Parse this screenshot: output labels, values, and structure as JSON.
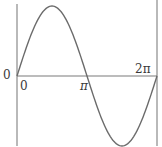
{
  "chart_data": {
    "type": "line",
    "title": "",
    "xlabel": "",
    "ylabel": "",
    "function": "sin(x)",
    "x_range": [
      0,
      6.2832
    ],
    "y_range": [
      -1,
      1
    ],
    "grid": false,
    "legend": null,
    "x_tick_labels": [
      "0",
      "π",
      "2π"
    ],
    "x_ticks": [
      0,
      3.1416,
      6.2832
    ],
    "y_tick_labels": [
      "0"
    ],
    "series": [
      {
        "name": "sin(x)",
        "x": [
          0,
          0.7854,
          1.5708,
          2.3562,
          3.1416,
          3.927,
          4.7124,
          5.4978,
          6.2832
        ],
        "values": [
          0,
          0.707,
          1,
          0.707,
          0,
          -0.707,
          -1,
          -0.707,
          0
        ]
      }
    ],
    "colors": {
      "curve": "#6b6b6b",
      "axis": "#7a7a7a",
      "label": "#3a3a3a"
    }
  },
  "labels": {
    "origin_y": "0",
    "origin_x": "0",
    "pi": "π",
    "two_pi": "2π"
  }
}
